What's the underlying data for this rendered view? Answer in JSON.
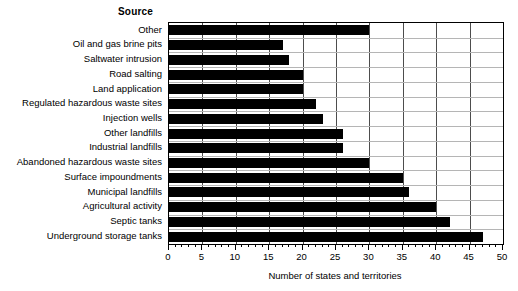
{
  "chart_data": {
    "type": "bar",
    "orientation": "horizontal",
    "title": "",
    "ylabel": "Source",
    "xlabel": "Number of states and territories",
    "xlim": [
      0,
      50
    ],
    "xtick_step": 5,
    "xminor_step": 1,
    "grid": "vertical major gridlines plus light horizontal separators",
    "legend": "none",
    "bar_color": "#000000",
    "categories": [
      "Other",
      "Oil and gas brine pits",
      "Saltwater intrusion",
      "Road salting",
      "Land application",
      "Regulated hazardous waste sites",
      "Injection wells",
      "Other landfills",
      "Industrial landfills",
      "Abandoned hazardous waste sites",
      "Surface impoundments",
      "Municipal landfills",
      "Agricultural activity",
      "Septic tanks",
      "Underground storage tanks"
    ],
    "values": [
      30,
      17,
      18,
      20,
      20,
      22,
      23,
      26,
      26,
      30,
      35,
      36,
      40,
      42,
      47
    ],
    "xticks": [
      0,
      5,
      10,
      15,
      20,
      25,
      30,
      35,
      40,
      45,
      50
    ],
    "xtick_labels": [
      "0",
      "5",
      "10",
      "15",
      "20",
      "25",
      "30",
      "35",
      "40",
      "45",
      "50"
    ]
  }
}
